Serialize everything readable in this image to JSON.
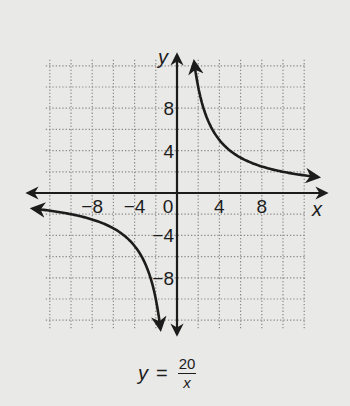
{
  "chart_data": {
    "type": "line",
    "title": "",
    "equation": "y = 20/x",
    "xlabel": "x",
    "ylabel": "y",
    "xlim": [
      -12,
      12
    ],
    "ylim": [
      -12,
      12
    ],
    "grid": true,
    "grid_style": "dotted",
    "grid_step": 2,
    "x_ticks": [
      -8,
      -4,
      0,
      4,
      8
    ],
    "x_tick_labels": [
      "−8",
      "−4",
      "0",
      "4",
      "8"
    ],
    "y_ticks": [
      8,
      4,
      -4,
      -8
    ],
    "y_tick_labels": [
      "8",
      "4",
      "−4",
      "−8"
    ],
    "series": [
      {
        "name": "y = 20/x (x > 0)",
        "x": [
          1.67,
          2,
          2.5,
          4,
          5,
          8,
          10,
          12.5
        ],
        "y": [
          12,
          10,
          8,
          5,
          4,
          2.5,
          2,
          1.6
        ]
      },
      {
        "name": "y = 20/x (x < 0)",
        "x": [
          -12.5,
          -10,
          -8,
          -5,
          -4,
          -2.5,
          -2,
          -1.67
        ],
        "y": [
          -1.6,
          -2,
          -2.5,
          -4,
          -5,
          -8,
          -10,
          -12
        ]
      }
    ],
    "colors": {
      "curve": "#1c1c1c",
      "axes": "#1c1c1c",
      "grid": "#8a8a8a",
      "background": "#e9e9e8"
    }
  },
  "labels": {
    "x_axis": "x",
    "y_axis": "y",
    "eq_lhs": "y",
    "eq_sign": "=",
    "eq_num": "20",
    "eq_den": "x"
  }
}
